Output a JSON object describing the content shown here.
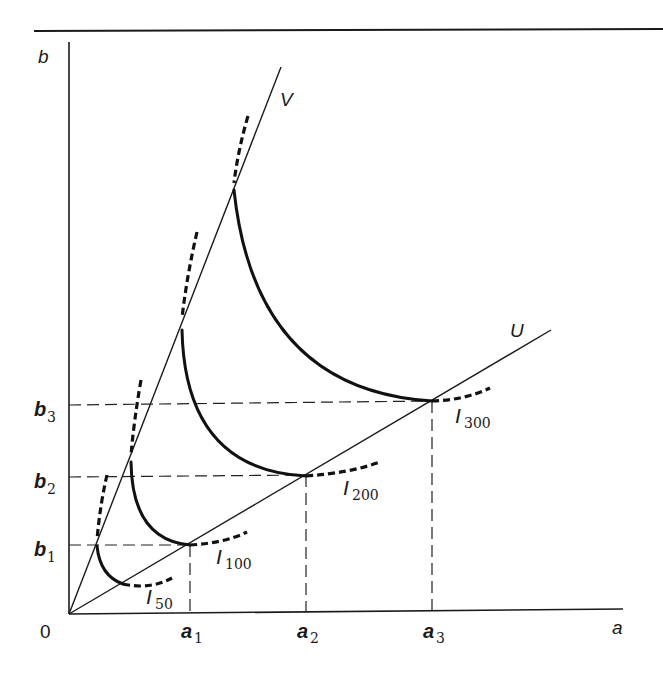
{
  "diagram": {
    "axes": {
      "x_label": "a",
      "y_label": "b",
      "origin_label": "0"
    },
    "rays": [
      {
        "name": "V",
        "label": "V"
      },
      {
        "name": "U",
        "label": "U"
      }
    ],
    "x_ticks": [
      {
        "base": "a",
        "sub": "1"
      },
      {
        "base": "a",
        "sub": "2"
      },
      {
        "base": "a",
        "sub": "3"
      }
    ],
    "y_ticks": [
      {
        "base": "b",
        "sub": "1"
      },
      {
        "base": "b",
        "sub": "2"
      },
      {
        "base": "b",
        "sub": "3"
      }
    ],
    "isoquants": [
      {
        "base": "I",
        "sub": "50"
      },
      {
        "base": "I",
        "sub": "100"
      },
      {
        "base": "I",
        "sub": "200"
      },
      {
        "base": "I",
        "sub": "300"
      }
    ]
  }
}
